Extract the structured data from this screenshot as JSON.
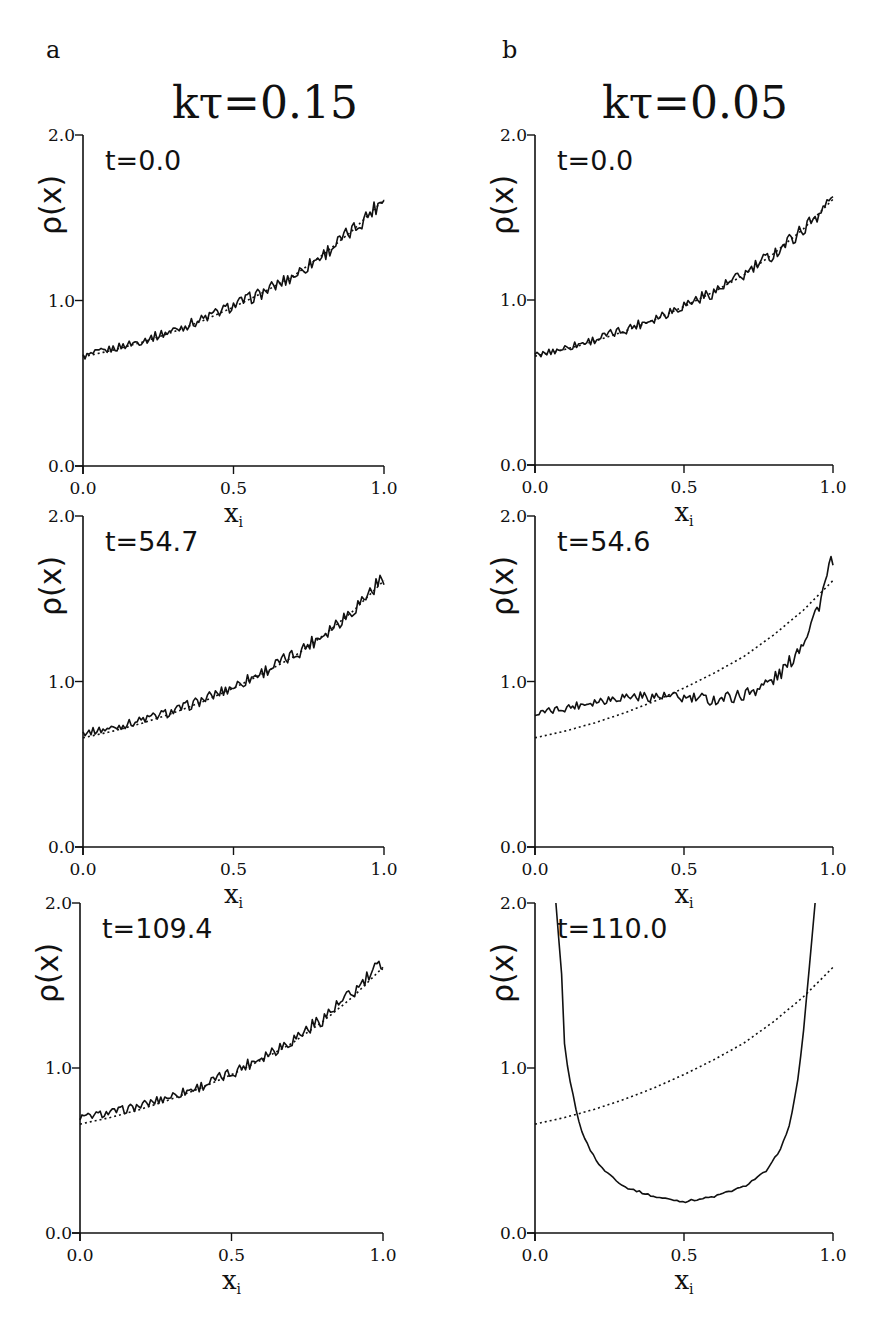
{
  "figure": {
    "columns": [
      {
        "panel_letter": "a",
        "title": "kτ=0.15"
      },
      {
        "panel_letter": "b",
        "title": "kτ=0.05"
      }
    ]
  },
  "chart_data": [
    {
      "type": "line",
      "panel": "a",
      "row": 1,
      "title": "kτ=0.15",
      "annotation": "t=0.0",
      "xlabel": "x_i",
      "ylabel": "ρ(x)",
      "xlim": [
        0.0,
        1.0
      ],
      "ylim": [
        0.0,
        2.0
      ],
      "xticks": [
        "0.0",
        "0.5",
        "1.0"
      ],
      "yticks": [
        "0.0",
        "1.0",
        "2.0"
      ],
      "series": [
        {
          "name": "simulation (solid, noisy)",
          "style": "solid",
          "x": [
            0.0,
            0.1,
            0.2,
            0.3,
            0.4,
            0.5,
            0.6,
            0.7,
            0.8,
            0.9,
            1.0
          ],
          "y": [
            0.66,
            0.71,
            0.76,
            0.82,
            0.89,
            0.97,
            1.05,
            1.15,
            1.28,
            1.43,
            1.62
          ]
        },
        {
          "name": "theory (dotted)",
          "style": "dotted",
          "x": [
            0.0,
            0.1,
            0.2,
            0.3,
            0.4,
            0.5,
            0.6,
            0.7,
            0.8,
            0.9,
            1.0
          ],
          "y": [
            0.66,
            0.7,
            0.75,
            0.81,
            0.88,
            0.96,
            1.05,
            1.15,
            1.28,
            1.43,
            1.61
          ]
        }
      ]
    },
    {
      "type": "line",
      "panel": "a",
      "row": 2,
      "annotation": "t=54.7",
      "xlabel": "x_i",
      "ylabel": "ρ(x)",
      "xlim": [
        0.0,
        1.0
      ],
      "ylim": [
        0.0,
        2.0
      ],
      "xticks": [
        "0.0",
        "0.5",
        "1.0"
      ],
      "yticks": [
        "0.0",
        "1.0",
        "2.0"
      ],
      "series": [
        {
          "name": "simulation (solid, noisy)",
          "style": "solid",
          "x": [
            0.0,
            0.1,
            0.2,
            0.3,
            0.4,
            0.5,
            0.6,
            0.7,
            0.8,
            0.9,
            1.0
          ],
          "y": [
            0.69,
            0.72,
            0.77,
            0.82,
            0.89,
            0.97,
            1.06,
            1.16,
            1.29,
            1.44,
            1.63
          ]
        },
        {
          "name": "theory (dotted)",
          "style": "dotted",
          "x": [
            0.0,
            0.1,
            0.2,
            0.3,
            0.4,
            0.5,
            0.6,
            0.7,
            0.8,
            0.9,
            1.0
          ],
          "y": [
            0.66,
            0.7,
            0.75,
            0.81,
            0.88,
            0.96,
            1.05,
            1.15,
            1.28,
            1.43,
            1.61
          ]
        }
      ]
    },
    {
      "type": "line",
      "panel": "a",
      "row": 3,
      "annotation": "t=109.4",
      "xlabel": "x_i",
      "ylabel": "ρ(x)",
      "xlim": [
        0.0,
        1.0
      ],
      "ylim": [
        0.0,
        2.0
      ],
      "xticks": [
        "0.0",
        "0.5",
        "1.0"
      ],
      "yticks": [
        "0.0",
        "1.0",
        "2.0"
      ],
      "series": [
        {
          "name": "simulation (solid, noisy)",
          "style": "solid",
          "x": [
            0.0,
            0.1,
            0.2,
            0.3,
            0.4,
            0.5,
            0.6,
            0.7,
            0.8,
            0.9,
            1.0
          ],
          "y": [
            0.7,
            0.73,
            0.77,
            0.83,
            0.89,
            0.97,
            1.07,
            1.17,
            1.3,
            1.45,
            1.64
          ]
        },
        {
          "name": "theory (dotted)",
          "style": "dotted",
          "x": [
            0.0,
            0.1,
            0.2,
            0.3,
            0.4,
            0.5,
            0.6,
            0.7,
            0.8,
            0.9,
            1.0
          ],
          "y": [
            0.66,
            0.7,
            0.75,
            0.81,
            0.88,
            0.96,
            1.05,
            1.15,
            1.28,
            1.43,
            1.61
          ]
        }
      ]
    },
    {
      "type": "line",
      "panel": "b",
      "row": 1,
      "title": "kτ=0.05",
      "annotation": "t=0.0",
      "xlabel": "x_i",
      "ylabel": "ρ(x)",
      "xlim": [
        0.0,
        1.0
      ],
      "ylim": [
        0.0,
        2.0
      ],
      "xticks": [
        "0.0",
        "0.5",
        "1.0"
      ],
      "yticks": [
        "0.0",
        "1.0",
        "2.0"
      ],
      "series": [
        {
          "name": "simulation (solid, noisy)",
          "style": "solid",
          "x": [
            0.0,
            0.1,
            0.2,
            0.3,
            0.4,
            0.5,
            0.6,
            0.7,
            0.8,
            0.9,
            1.0
          ],
          "y": [
            0.66,
            0.71,
            0.76,
            0.82,
            0.89,
            0.97,
            1.05,
            1.15,
            1.28,
            1.43,
            1.62
          ]
        },
        {
          "name": "theory (dotted)",
          "style": "dotted",
          "x": [
            0.0,
            0.1,
            0.2,
            0.3,
            0.4,
            0.5,
            0.6,
            0.7,
            0.8,
            0.9,
            1.0
          ],
          "y": [
            0.66,
            0.7,
            0.75,
            0.81,
            0.88,
            0.96,
            1.05,
            1.15,
            1.28,
            1.43,
            1.61
          ]
        }
      ]
    },
    {
      "type": "line",
      "panel": "b",
      "row": 2,
      "annotation": "t=54.6",
      "xlabel": "x_i",
      "ylabel": "ρ(x)",
      "xlim": [
        0.0,
        1.0
      ],
      "ylim": [
        0.0,
        2.0
      ],
      "xticks": [
        "0.0",
        "0.5",
        "1.0"
      ],
      "yticks": [
        "0.0",
        "1.0",
        "2.0"
      ],
      "series": [
        {
          "name": "simulation (solid, noisy)",
          "style": "solid",
          "x": [
            0.0,
            0.1,
            0.2,
            0.3,
            0.4,
            0.5,
            0.6,
            0.7,
            0.8,
            0.85,
            0.9,
            0.95,
            1.0
          ],
          "y": [
            0.8,
            0.84,
            0.88,
            0.91,
            0.91,
            0.9,
            0.89,
            0.92,
            1.01,
            1.1,
            1.25,
            1.45,
            1.75
          ]
        },
        {
          "name": "theory (dotted)",
          "style": "dotted",
          "x": [
            0.0,
            0.1,
            0.2,
            0.3,
            0.4,
            0.5,
            0.6,
            0.7,
            0.8,
            0.9,
            1.0
          ],
          "y": [
            0.66,
            0.7,
            0.75,
            0.81,
            0.88,
            0.96,
            1.05,
            1.15,
            1.28,
            1.43,
            1.61
          ]
        }
      ]
    },
    {
      "type": "line",
      "panel": "b",
      "row": 3,
      "annotation": "t=110.0",
      "xlabel": "x_i",
      "ylabel": "ρ(x)",
      "xlim": [
        0.0,
        1.0
      ],
      "ylim": [
        0.0,
        2.0
      ],
      "xticks": [
        "0.0",
        "0.5",
        "1.0"
      ],
      "yticks": [
        "0.0",
        "1.0",
        "2.0"
      ],
      "series": [
        {
          "name": "simulation (solid, U-shaped)",
          "style": "solid",
          "x": [
            0.07,
            0.09,
            0.1,
            0.12,
            0.15,
            0.18,
            0.22,
            0.3,
            0.4,
            0.5,
            0.6,
            0.7,
            0.78,
            0.82,
            0.85,
            0.88,
            0.9,
            0.92,
            0.94
          ],
          "y": [
            2.0,
            1.55,
            1.1,
            0.9,
            0.65,
            0.52,
            0.4,
            0.28,
            0.22,
            0.19,
            0.22,
            0.28,
            0.38,
            0.5,
            0.62,
            0.9,
            1.2,
            1.6,
            2.0
          ]
        },
        {
          "name": "theory (dotted)",
          "style": "dotted",
          "x": [
            0.0,
            0.1,
            0.2,
            0.3,
            0.4,
            0.5,
            0.6,
            0.7,
            0.8,
            0.9,
            1.0
          ],
          "y": [
            0.66,
            0.7,
            0.75,
            0.81,
            0.88,
            0.96,
            1.05,
            1.15,
            1.28,
            1.43,
            1.61
          ]
        }
      ]
    }
  ]
}
